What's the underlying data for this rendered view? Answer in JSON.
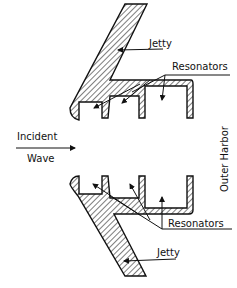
{
  "diagram": {
    "labels": {
      "jetty_top": "Jetty",
      "resonators_top": "Resonators",
      "incident": "Incident",
      "wave": "Wave",
      "outer_harbor": "Outer Harbor",
      "resonators_bottom": "Resonators",
      "jetty_bottom": "Jetty"
    },
    "colors": {
      "ink": "#111111",
      "background": "#ffffff"
    }
  }
}
